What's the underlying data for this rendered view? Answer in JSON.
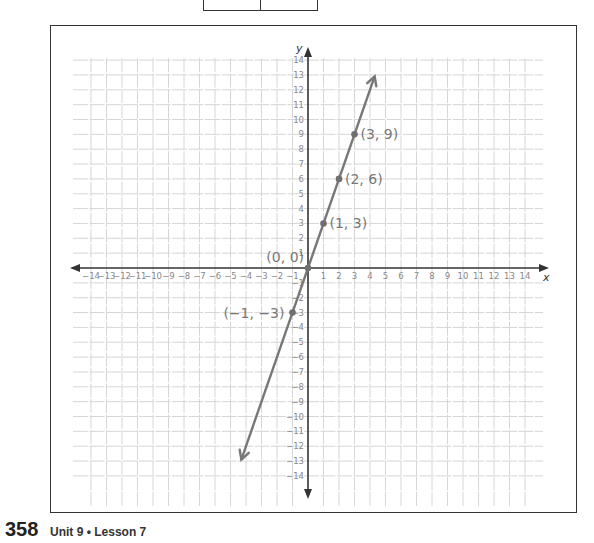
{
  "top_table": {
    "cells": [
      "3",
      "9"
    ]
  },
  "footer": {
    "page_number": "358",
    "lesson": "Unit 9 • Lesson 7"
  },
  "chart_data": {
    "type": "line",
    "title": "",
    "xlabel": "x",
    "ylabel": "y",
    "xlim": [
      -14,
      14
    ],
    "ylim": [
      -14,
      14
    ],
    "grid": true,
    "x_ticks": [
      -14,
      -13,
      -12,
      -11,
      -10,
      -9,
      -8,
      -7,
      -6,
      -5,
      -4,
      -3,
      -2,
      -1,
      1,
      2,
      3,
      4,
      5,
      6,
      7,
      8,
      9,
      10,
      11,
      12,
      13,
      14
    ],
    "y_ticks": [
      -14,
      -13,
      -12,
      -11,
      -10,
      -9,
      -8,
      -7,
      -6,
      -5,
      -4,
      -3,
      -2,
      -1,
      1,
      2,
      3,
      4,
      5,
      6,
      7,
      8,
      9,
      10,
      11,
      12,
      13,
      14
    ],
    "series": [
      {
        "name": "y = 3x",
        "line_extent_x": [
          -4.3,
          4.3
        ],
        "arrows": "both",
        "color": "#777777",
        "points": [
          {
            "x": -1,
            "y": -3,
            "label": "(−1, −3)"
          },
          {
            "x": 0,
            "y": 0,
            "label": "(0, 0)"
          },
          {
            "x": 1,
            "y": 3,
            "label": "(1, 3)"
          },
          {
            "x": 2,
            "y": 6,
            "label": "(2, 6)"
          },
          {
            "x": 3,
            "y": 9,
            "label": "(3, 9)"
          }
        ]
      }
    ]
  }
}
